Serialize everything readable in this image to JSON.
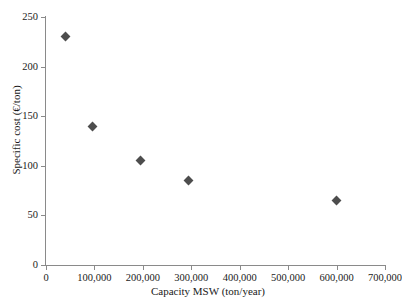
{
  "chart_data": {
    "type": "scatter",
    "title": "",
    "xlabel": "Capacity MSW (ton/year)",
    "ylabel": "Specific cost (€/ton)",
    "xlim": [
      0,
      700000
    ],
    "ylim": [
      0,
      250
    ],
    "grid": false,
    "legend": null,
    "marker": "diamond",
    "marker_color": "#4d4d4d",
    "xticks": [
      0,
      100000,
      200000,
      300000,
      400000,
      500000,
      600000,
      700000
    ],
    "xtick_labels": [
      "0",
      "100,000",
      "200,000",
      "300,000",
      "400,000",
      "500,000",
      "600,000",
      "700,000"
    ],
    "yticks": [
      0,
      50,
      100,
      150,
      200,
      250
    ],
    "ytick_labels": [
      "0",
      "50",
      "100",
      "150",
      "200",
      "250"
    ],
    "points": [
      {
        "x": 40000,
        "y": 230
      },
      {
        "x": 95000,
        "y": 140
      },
      {
        "x": 195000,
        "y": 105
      },
      {
        "x": 295000,
        "y": 85
      },
      {
        "x": 600000,
        "y": 65
      }
    ]
  }
}
